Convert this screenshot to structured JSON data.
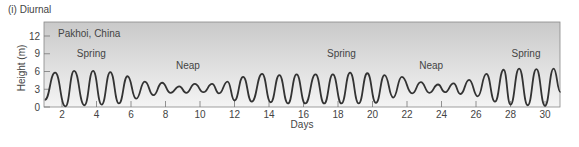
{
  "chart_data": {
    "type": "line",
    "panel_label": "(i) Diurnal",
    "title": "Pakhoi, China",
    "xlabel": "Days",
    "ylabel": "Height (m)",
    "xlim": [
      1,
      30.9
    ],
    "ylim": [
      0,
      14
    ],
    "x_ticks": [
      2,
      4,
      6,
      8,
      10,
      12,
      14,
      16,
      18,
      20,
      22,
      24,
      26,
      28,
      30
    ],
    "y_ticks": [
      0,
      3,
      6,
      9,
      12
    ],
    "grid": false,
    "annotations": [
      {
        "text": "Spring",
        "x": 3.7,
        "y": 8.5
      },
      {
        "text": "Neap",
        "x": 9.3,
        "y": 6.5
      },
      {
        "text": "Spring",
        "x": 18.2,
        "y": 8.5
      },
      {
        "text": "Neap",
        "x": 23.4,
        "y": 6.5
      },
      {
        "text": "Spring",
        "x": 28.9,
        "y": 8.5
      }
    ],
    "series": [
      {
        "name": "Tide height",
        "peaks": [
          [
            1.6,
            5.8
          ],
          [
            2.7,
            6.1
          ],
          [
            3.8,
            6.1
          ],
          [
            4.8,
            5.9
          ],
          [
            5.8,
            5.2
          ],
          [
            6.8,
            4.3
          ],
          [
            7.8,
            4.1
          ],
          [
            8.8,
            3.5
          ],
          [
            9.7,
            3.9
          ],
          [
            10.7,
            3.9
          ],
          [
            11.6,
            4.3
          ],
          [
            12.5,
            5.1
          ],
          [
            13.6,
            5.6
          ],
          [
            14.6,
            5.4
          ],
          [
            15.6,
            5.5
          ],
          [
            16.7,
            5.5
          ],
          [
            17.7,
            5.5
          ],
          [
            18.7,
            5.8
          ],
          [
            19.7,
            5.7
          ],
          [
            20.7,
            5.4
          ],
          [
            21.7,
            5.1
          ],
          [
            22.8,
            4.2
          ],
          [
            23.8,
            3.8
          ],
          [
            24.7,
            4.0
          ],
          [
            25.6,
            4.6
          ],
          [
            26.6,
            5.6
          ],
          [
            27.6,
            6.3
          ],
          [
            28.5,
            6.5
          ],
          [
            29.5,
            6.4
          ],
          [
            30.5,
            6.5
          ]
        ],
        "troughs": [
          [
            1.0,
            1.2
          ],
          [
            2.2,
            0.1
          ],
          [
            3.3,
            0.3
          ],
          [
            4.3,
            0.4
          ],
          [
            5.3,
            0.6
          ],
          [
            6.3,
            1.4
          ],
          [
            7.3,
            2.0
          ],
          [
            8.3,
            2.4
          ],
          [
            9.2,
            2.4
          ],
          [
            10.2,
            2.5
          ],
          [
            11.1,
            2.3
          ],
          [
            12.0,
            1.1
          ],
          [
            13.0,
            0.9
          ],
          [
            14.1,
            0.8
          ],
          [
            15.1,
            0.6
          ],
          [
            16.1,
            0.6
          ],
          [
            17.2,
            0.6
          ],
          [
            18.2,
            0.6
          ],
          [
            19.2,
            0.6
          ],
          [
            20.2,
            0.7
          ],
          [
            21.2,
            1.6
          ],
          [
            22.3,
            2.3
          ],
          [
            23.3,
            2.4
          ],
          [
            24.2,
            2.5
          ],
          [
            25.1,
            2.2
          ],
          [
            26.1,
            1.8
          ],
          [
            27.1,
            0.9
          ],
          [
            28.0,
            0.4
          ],
          [
            29.0,
            0.3
          ],
          [
            30.0,
            0.2
          ],
          [
            30.9,
            2.5
          ]
        ]
      }
    ]
  }
}
